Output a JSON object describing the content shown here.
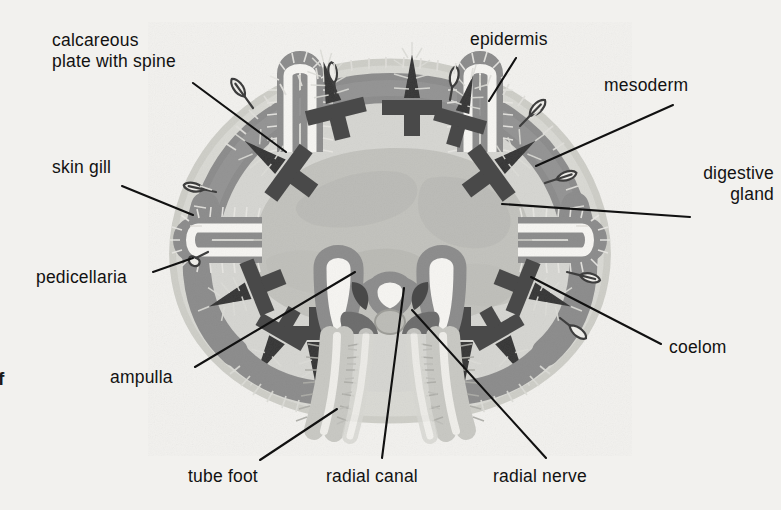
{
  "figure": {
    "background_color": "#f2f1ee",
    "ink_color": "#121212",
    "partial_edge_glyph": "f",
    "palette": {
      "body_wall_mesoderm": "#8e8e8e",
      "body_wall_mesoderm_dark": "#7d7d7d",
      "calcareous_plate": "#4a4a4a",
      "spine": "#3d3d3d",
      "coelom_fill": "#d6d6d2",
      "digestive_gland": "#c2c2bd",
      "epidermis_cilia": "#b9b9b4",
      "lumen_white": "#f6f5f2",
      "radial_nerve": "#bdbdb8",
      "tube_foot_wall": "#c9c9c4",
      "leader_line": "#111111"
    }
  },
  "labels": [
    {
      "id": "calcareous-plate-with-spine",
      "text_line1": "calcareous",
      "text_line2": "plate with spine",
      "x": 52,
      "y": 30,
      "align": "left",
      "leader": {
        "x1": 193,
        "y1": 83,
        "x2": 286,
        "y2": 152
      }
    },
    {
      "id": "skin-gill",
      "text_line1": "skin gill",
      "text_line2": "",
      "x": 52,
      "y": 157,
      "align": "left",
      "leader": {
        "x1": 122,
        "y1": 186,
        "x2": 193,
        "y2": 215
      }
    },
    {
      "id": "pedicellaria",
      "text_line1": "pedicellaria",
      "text_line2": "",
      "x": 36,
      "y": 267,
      "align": "left",
      "leader": {
        "x1": 153,
        "y1": 272,
        "x2": 193,
        "y2": 258
      }
    },
    {
      "id": "ampulla",
      "text_line1": "ampulla",
      "text_line2": "",
      "x": 110,
      "y": 367,
      "align": "left",
      "leader": {
        "x1": 195,
        "y1": 367,
        "x2": 355,
        "y2": 272
      }
    },
    {
      "id": "tube-foot",
      "text_line1": "tube foot",
      "text_line2": "",
      "x": 188,
      "y": 466,
      "align": "left",
      "leader": {
        "x1": 260,
        "y1": 460,
        "x2": 337,
        "y2": 409
      }
    },
    {
      "id": "radial-canal",
      "text_line1": "radial canal",
      "text_line2": "",
      "x": 326,
      "y": 466,
      "align": "left",
      "leader": {
        "x1": 382,
        "y1": 458,
        "x2": 404,
        "y2": 288
      }
    },
    {
      "id": "radial-nerve",
      "text_line1": "radial nerve",
      "text_line2": "",
      "x": 493,
      "y": 466,
      "align": "left",
      "leader": {
        "x1": 546,
        "y1": 458,
        "x2": 412,
        "y2": 310
      }
    },
    {
      "id": "epidermis",
      "text_line1": "epidermis",
      "text_line2": "",
      "x": 470,
      "y": 29,
      "align": "left",
      "leader": {
        "x1": 516,
        "y1": 58,
        "x2": 489,
        "y2": 101
      }
    },
    {
      "id": "mesoderm",
      "text_line1": "mesoderm",
      "text_line2": "",
      "x": 604,
      "y": 75,
      "align": "left",
      "leader": {
        "x1": 673,
        "y1": 105,
        "x2": 536,
        "y2": 166
      }
    },
    {
      "id": "digestive-gland",
      "text_line1": "digestive",
      "text_line2": "gland",
      "x": 676,
      "y": 163,
      "align": "left",
      "leader": {
        "x1": 690,
        "y1": 217,
        "x2": 502,
        "y2": 204
      }
    },
    {
      "id": "coelom",
      "text_line1": "coelom",
      "text_line2": "",
      "x": 669,
      "y": 337,
      "align": "left",
      "leader": {
        "x1": 661,
        "y1": 344,
        "x2": 531,
        "y2": 277
      }
    }
  ]
}
